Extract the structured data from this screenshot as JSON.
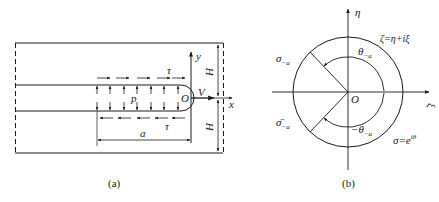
{
  "figure": {
    "panel_a": {
      "caption": "(a)",
      "labels": {
        "y_axis": "y",
        "x_axis": "x",
        "origin": "O",
        "velocity": "V",
        "pressure": "p",
        "shear_top": "τ",
        "shear_bottom": "τ",
        "crack_length": "a",
        "half_height_top": "H",
        "half_height_bottom": "H"
      }
    },
    "panel_b": {
      "caption": "(b)",
      "labels": {
        "eta_axis": "η",
        "xi_axis": "ξ",
        "origin": "O",
        "mapping": "ζ=η+iξ",
        "sigma_minus_a": "σ",
        "sigma_minus_a_sub": "−a",
        "sigma_bar_minus_a": "σ̄",
        "sigma_bar_minus_a_sub": "−a",
        "theta_minus_a": "θ",
        "theta_minus_a_sub": "−a",
        "neg_theta_minus_a": "−θ",
        "neg_theta_minus_a_sub": "−a",
        "unit_circle": "σ=e",
        "unit_circle_sup": "iθ"
      }
    }
  }
}
